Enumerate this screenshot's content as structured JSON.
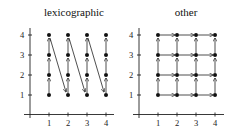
{
  "panels": [
    {
      "title": "lexicographic",
      "x_ticks": [
        "1",
        "2",
        "3",
        "4"
      ],
      "y_ticks": [
        "1",
        "2",
        "3",
        "4"
      ],
      "points": "4x4 grid (1..4, 1..4)",
      "traversal": "column-wise upward, diagonal jump from top of column i to bottom of column i+1"
    },
    {
      "title": "other",
      "x_ticks": [
        "1",
        "2",
        "3",
        "4"
      ],
      "y_ticks": [
        "1",
        "2",
        "3",
        "4"
      ],
      "points": "4x4 grid (1..4, 1..4)",
      "traversal": "arrows rightward along every row and upward along every column"
    }
  ]
}
